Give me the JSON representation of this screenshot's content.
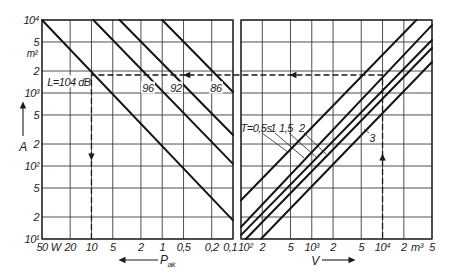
{
  "chart_data": [
    {
      "id": "left",
      "type": "line",
      "title": "",
      "xlabel": "P_ak",
      "xlabel_main": "P",
      "xlabel_sub": "ak",
      "x_unit": "W",
      "x_unit_at": 32,
      "x_scale": "log",
      "xlim": [
        50,
        0.1
      ],
      "x_direction": "decreasing to the right",
      "x_ticks": [
        50,
        20,
        10,
        5,
        2,
        1,
        0.5,
        0.2,
        0.1
      ],
      "x_tick_labels": [
        "50",
        "20",
        "10",
        "5",
        "2",
        "1",
        "0,5",
        "0,2",
        "0,1"
      ],
      "ylabel": "A",
      "y_unit": "m²",
      "y_unit_at": 3500,
      "y_scale": "log",
      "ylim": [
        10,
        10000
      ],
      "y_ticks": [
        10,
        20,
        50,
        100,
        200,
        500,
        1000,
        2000,
        5000,
        10000
      ],
      "y_tick_labels": [
        "10¹",
        "2",
        "5",
        "10²",
        "2",
        "5",
        "10³",
        "2",
        "5",
        "10⁴"
      ],
      "show_y_labels": true,
      "grid": true,
      "legend": null,
      "series": [
        {
          "name": "L=104 dB",
          "label": "L=104 dB",
          "L_dB": 104,
          "points": [
            [
              50,
              10000
            ],
            [
              0.1,
              18
            ]
          ],
          "label_at": [
            20.8,
            1416
          ],
          "label_bg": true
        },
        {
          "name": "L=96 dB",
          "label": "96",
          "L_dB": 96,
          "points": [
            [
              9.4,
              10000
            ],
            [
              0.1,
              107
            ]
          ],
          "label_at": [
            1.59,
            1171
          ],
          "label_bg": true
        },
        {
          "name": "L=92 dB",
          "label": "92",
          "L_dB": 92,
          "points": [
            [
              4.0,
              10000
            ],
            [
              0.1,
              266
            ]
          ],
          "label_at": [
            0.64,
            1171
          ],
          "label_bg": true
        },
        {
          "name": "L=86 dB",
          "label": "86",
          "L_dB": 86,
          "points": [
            [
              1.0,
              10000
            ],
            [
              0.1,
              1030
            ]
          ],
          "label_at": [
            0.174,
            1171
          ],
          "label_bg": true
        }
      ]
    },
    {
      "id": "right",
      "type": "line",
      "title": "",
      "xlabel": "V",
      "x_unit": "m³",
      "x_unit_at": 30700,
      "x_scale": "log",
      "xlim": [
        100,
        50000
      ],
      "x_ticks": [
        100,
        200,
        500,
        1000,
        2000,
        5000,
        10000,
        20000,
        50000
      ],
      "x_tick_labels": [
        "10²",
        "2",
        "5",
        "10³",
        "2",
        "5",
        "10⁴",
        "2",
        "5"
      ],
      "ylabel": "A",
      "y_unit": "m²",
      "y_scale": "log",
      "ylim": [
        10,
        10000
      ],
      "y_ticks": [
        10,
        20,
        50,
        100,
        200,
        500,
        1000,
        2000,
        5000,
        10000
      ],
      "y_tick_labels": [
        "10¹",
        "2",
        "5",
        "10²",
        "2",
        "5",
        "10³",
        "2",
        "5",
        "10⁴"
      ],
      "show_y_labels": false,
      "grid": true,
      "legend": null,
      "series": [
        {
          "name": "T=0,5 s",
          "label": "T=0,5s",
          "T_s": 0.5,
          "points": [
            [
              100,
              34
            ],
            [
              30100,
              10000
            ]
          ],
          "label_at": [
            163,
            331
          ],
          "leader": [
            [
              198,
              283
            ],
            [
              461,
              155
            ]
          ]
        },
        {
          "name": "T=1 s",
          "label": "1",
          "T_s": 1,
          "points": [
            [
              100,
              14.6
            ],
            [
              50000,
              8500
            ]
          ],
          "label_at": [
            283,
            331
          ],
          "leader": [
            [
              302,
              283
            ],
            [
              777,
              129
            ]
          ]
        },
        {
          "name": "T=1,5 s",
          "label": "1,5",
          "T_s": 1.5,
          "points": [
            [
              100,
              11.3
            ],
            [
              50000,
              5320
            ]
          ],
          "label_at": [
            432,
            331
          ],
          "leader": [
            [
              477,
              283
            ],
            [
              1148,
              133
            ]
          ]
        },
        {
          "name": "T=2 s",
          "label": "2",
          "T_s": 2,
          "points": [
            [
              117,
              10
            ],
            [
              50000,
              4130
            ]
          ],
          "label_at": [
            726,
            331
          ],
          "leader": [
            [
              777,
              283
            ],
            [
              1589,
              146
            ]
          ]
        },
        {
          "name": "T=3 s",
          "label": "3",
          "T_s": 3,
          "points": [
            [
              191,
              10
            ],
            [
              50000,
              2660
            ]
          ],
          "label_at": [
            7100,
            242
          ],
          "leader": [
            [
              6440,
              283
            ],
            [
              5470,
              321
            ]
          ]
        }
      ]
    }
  ],
  "example_path": {
    "V_m3": 10000,
    "T_s": 1,
    "A_m2": 1765,
    "L_dB": 104,
    "P_ak_W": 10,
    "arrows": [
      {
        "panel": "right",
        "at": [
          10000,
          133
        ],
        "dir": "up"
      },
      {
        "panel": "right",
        "at": [
          542,
          1765
        ],
        "dir": "left"
      },
      {
        "panel": "left",
        "at": [
          0.45,
          1765
        ],
        "dir": "left"
      },
      {
        "panel": "left",
        "at": [
          10,
          133
        ],
        "dir": "down"
      }
    ]
  }
}
